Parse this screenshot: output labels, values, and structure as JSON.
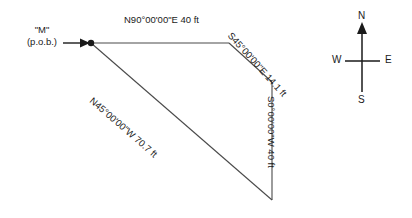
{
  "figure": {
    "type": "survey-traverse-diagram",
    "background_color": "#ffffff",
    "line_color": "#4a4a4a",
    "text_color": "#1a1a1a",
    "point_of_beginning": {
      "name": "\"M\"",
      "sublabel": "(p.o.b.)"
    },
    "courses": [
      {
        "id": "north-boundary",
        "label": "N90°00'00\"E 40 ft",
        "bearing": "N90°00'00\"E",
        "distance": "40 ft",
        "direction": "east"
      },
      {
        "id": "southeast-boundary",
        "label": "S45°00'00\"E 14.1 ft",
        "bearing": "S45°00'00\"E",
        "distance": "14.1 ft",
        "direction": "southeast"
      },
      {
        "id": "south-boundary",
        "label": "S0°00'00\"W 40 ft",
        "bearing": "S0°00'00\"W",
        "distance": "40 ft",
        "direction": "south"
      },
      {
        "id": "northwest-boundary",
        "label": "N45°00'00\"W 70.7 ft",
        "bearing": "N45°00'00\"W",
        "distance": "70.7 ft",
        "direction": "northwest"
      }
    ]
  },
  "compass": {
    "north": "N",
    "south": "S",
    "west": "W",
    "east": "E"
  }
}
